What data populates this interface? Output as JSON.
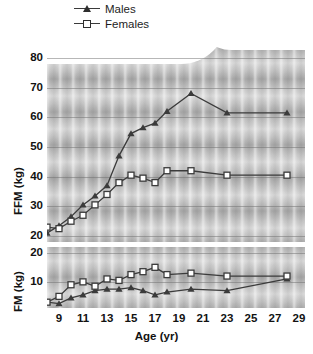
{
  "legend": {
    "items": [
      {
        "label": "Males",
        "marker": "filled-triangle",
        "color": "#2e2e2e"
      },
      {
        "label": "Females",
        "marker": "open-square",
        "color": "#2e2e2e"
      }
    ]
  },
  "axes": {
    "x_label": "Age (yr)",
    "x_ticks": [
      "9",
      "11",
      "13",
      "15",
      "17",
      "19",
      "21",
      "23",
      "25",
      "27",
      "29"
    ],
    "ffm_label": "FFM (kg)",
    "ffm_ticks": [
      "80",
      "70",
      "60",
      "50",
      "40",
      "30",
      "20"
    ],
    "fm_label": "FM (kg)",
    "fm_ticks": [
      "20",
      "10"
    ]
  },
  "caption": "",
  "chart_data": {
    "type": "line",
    "title": "",
    "xlabel": "Age (yr)",
    "xlim": [
      8,
      29.5
    ],
    "grid": true,
    "legend_position": "top-center",
    "panels": [
      {
        "name": "FFM",
        "ylabel": "FFM (kg)",
        "ylim": [
          18,
          84
        ],
        "yticks": [
          20,
          30,
          40,
          50,
          60,
          70,
          80
        ],
        "series": [
          {
            "name": "Males",
            "marker": "filled-triangle",
            "color": "#3b3b3b",
            "x": [
              8,
              9,
              10,
              11,
              12,
              13,
              14,
              15,
              16,
              17,
              18,
              20,
              23,
              28
            ],
            "values": [
              21.0,
              23.5,
              26.5,
              30.5,
              33.5,
              37.0,
              47.0,
              54.5,
              56.5,
              58.0,
              62.0,
              68.0,
              61.5,
              61.5
            ]
          },
          {
            "name": "Females",
            "marker": "open-square",
            "color": "#3b3b3b",
            "x": [
              8,
              9,
              10,
              11,
              12,
              13,
              14,
              15,
              16,
              17,
              18,
              20,
              23,
              28
            ],
            "values": [
              23.0,
              22.5,
              25.0,
              27.0,
              30.5,
              34.0,
              38.0,
              40.5,
              39.5,
              38.0,
              42.0,
              42.0,
              40.5,
              40.5
            ]
          }
        ]
      },
      {
        "name": "FM",
        "ylabel": "FM (kg)",
        "ylim": [
          1,
          22
        ],
        "yticks": [
          10,
          20
        ],
        "series": [
          {
            "name": "Males",
            "marker": "filled-triangle",
            "color": "#3b3b3b",
            "x": [
              8,
              9,
              10,
              11,
              12,
              13,
              14,
              15,
              16,
              17,
              18,
              20,
              23,
              28
            ],
            "values": [
              3.0,
              2.5,
              4.5,
              5.5,
              7.0,
              7.5,
              7.5,
              8.0,
              7.0,
              5.5,
              6.5,
              7.5,
              7.0,
              11.0
            ]
          },
          {
            "name": "Females",
            "marker": "open-square",
            "color": "#3b3b3b",
            "x": [
              8,
              9,
              10,
              11,
              12,
              13,
              14,
              15,
              16,
              17,
              18,
              20,
              23,
              28
            ],
            "values": [
              3.0,
              5.0,
              9.0,
              10.0,
              8.5,
              11.0,
              10.5,
              12.5,
              13.5,
              15.0,
              12.5,
              13.0,
              12.0,
              12.0
            ]
          }
        ]
      }
    ]
  }
}
